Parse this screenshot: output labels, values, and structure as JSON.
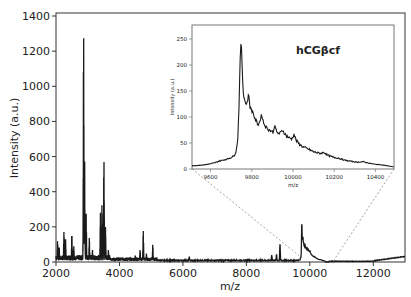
{
  "chart_data": [
    {
      "type": "line",
      "role": "main",
      "title": "",
      "xlabel": "m/z",
      "ylabel": "Intensity (a.u.)",
      "xlim": [
        2000,
        13000
      ],
      "ylim": [
        0,
        1420
      ],
      "xticks": [
        2000,
        4000,
        6000,
        8000,
        10000,
        12000
      ],
      "yticks": [
        0,
        200,
        400,
        600,
        800,
        1000,
        1200,
        1400
      ],
      "grid": false,
      "line_color": "#1a1a1a",
      "peaks": [
        {
          "x": 2050,
          "y": 120
        },
        {
          "x": 2100,
          "y": 90
        },
        {
          "x": 2250,
          "y": 175
        },
        {
          "x": 2300,
          "y": 140
        },
        {
          "x": 2500,
          "y": 160
        },
        {
          "x": 2560,
          "y": 90
        },
        {
          "x": 2870,
          "y": 1300
        },
        {
          "x": 2900,
          "y": 620
        },
        {
          "x": 2950,
          "y": 280
        },
        {
          "x": 3050,
          "y": 140
        },
        {
          "x": 3150,
          "y": 70
        },
        {
          "x": 3400,
          "y": 280
        },
        {
          "x": 3450,
          "y": 330
        },
        {
          "x": 3510,
          "y": 580
        },
        {
          "x": 3560,
          "y": 200
        },
        {
          "x": 3650,
          "y": 70
        },
        {
          "x": 4500,
          "y": 40
        },
        {
          "x": 4650,
          "y": 70
        },
        {
          "x": 4750,
          "y": 180
        },
        {
          "x": 4850,
          "y": 50
        },
        {
          "x": 5050,
          "y": 100
        },
        {
          "x": 6200,
          "y": 30
        },
        {
          "x": 8800,
          "y": 40
        },
        {
          "x": 8950,
          "y": 45
        },
        {
          "x": 9060,
          "y": 105
        },
        {
          "x": 9750,
          "y": 252
        },
        {
          "x": 9800,
          "y": 140
        },
        {
          "x": 10000,
          "y": 70
        },
        {
          "x": 10400,
          "y": 10
        },
        {
          "x": 11800,
          "y": 5
        },
        {
          "x": 13000,
          "y": 30
        }
      ]
    },
    {
      "type": "line",
      "role": "inset",
      "title": "hCGβcf",
      "xlabel": "m/z",
      "ylabel": "Intensity (a.u.)",
      "xlim": [
        9510,
        10490
      ],
      "ylim": [
        0,
        277
      ],
      "xticks": [
        9600,
        9800,
        10000,
        10200,
        10400
      ],
      "yticks": [
        0,
        50,
        100,
        150,
        200,
        250
      ],
      "grid": false,
      "line_color": "#1a1a1a",
      "points": [
        [
          9510,
          6
        ],
        [
          9540,
          7
        ],
        [
          9570,
          8
        ],
        [
          9600,
          10
        ],
        [
          9620,
          12
        ],
        [
          9640,
          15
        ],
        [
          9660,
          17
        ],
        [
          9680,
          19
        ],
        [
          9700,
          22
        ],
        [
          9715,
          26
        ],
        [
          9725,
          35
        ],
        [
          9732,
          60
        ],
        [
          9738,
          120
        ],
        [
          9743,
          200
        ],
        [
          9748,
          252
        ],
        [
          9753,
          200
        ],
        [
          9758,
          150
        ],
        [
          9763,
          138
        ],
        [
          9770,
          125
        ],
        [
          9778,
          128
        ],
        [
          9785,
          145
        ],
        [
          9792,
          118
        ],
        [
          9800,
          112
        ],
        [
          9808,
          108
        ],
        [
          9815,
          95
        ],
        [
          9822,
          92
        ],
        [
          9830,
          85
        ],
        [
          9838,
          90
        ],
        [
          9848,
          105
        ],
        [
          9858,
          88
        ],
        [
          9870,
          80
        ],
        [
          9882,
          76
        ],
        [
          9895,
          73
        ],
        [
          9905,
          70
        ],
        [
          9912,
          87
        ],
        [
          9920,
          70
        ],
        [
          9935,
          68
        ],
        [
          9950,
          75
        ],
        [
          9965,
          65
        ],
        [
          9980,
          60
        ],
        [
          9995,
          58
        ],
        [
          10005,
          67
        ],
        [
          10015,
          55
        ],
        [
          10030,
          48
        ],
        [
          10050,
          42
        ],
        [
          10075,
          38
        ],
        [
          10100,
          33
        ],
        [
          10130,
          30
        ],
        [
          10150,
          32
        ],
        [
          10170,
          26
        ],
        [
          10200,
          22
        ],
        [
          10220,
          21
        ],
        [
          10250,
          17
        ],
        [
          10280,
          15
        ],
        [
          10310,
          13
        ],
        [
          10340,
          14
        ],
        [
          10370,
          11
        ],
        [
          10400,
          9
        ],
        [
          10430,
          8
        ],
        [
          10460,
          6
        ],
        [
          10490,
          4
        ]
      ]
    }
  ],
  "labels": {
    "main_xlabel": "m/z",
    "main_ylabel": "Intensity (a.u.)",
    "inset_title": "hCGβcf",
    "inset_xlabel": "m/z",
    "inset_ylabel": "Intensity (a.u.)"
  }
}
